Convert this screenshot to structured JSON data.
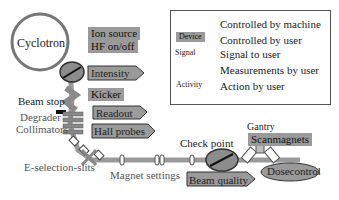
{
  "diagram": {
    "nodes": {
      "cyclotron": "Cyclotron",
      "ion_source": "Ion source",
      "hf": "HF on/off",
      "intensity": "Intensity",
      "kicker": "Kicker",
      "beam_stop": "Beam stop",
      "degrader": "Degrader",
      "collimators": "Collimators",
      "readout": "Readout",
      "hall_probes": "Hall probes",
      "e_selection": "E-selection-slits",
      "magnet_settings": "Magnet settings",
      "check_point": "Check point",
      "beam_quality": "Beam quality",
      "gantry": "Gantry",
      "scanmagnets": "Scanmagnets",
      "dosecontrol": "Dosecontrol"
    },
    "legend": {
      "items": [
        {
          "symbol": "magnet-and-slit",
          "label": "Controlled by machine"
        },
        {
          "symbol": "Device",
          "label": "Controlled by user"
        },
        {
          "symbol": "Signal",
          "label": "Signal to user"
        },
        {
          "symbol": "gauge",
          "label": "Measurements by user"
        },
        {
          "symbol": "Activity",
          "label": "Action by user"
        }
      ]
    },
    "colors": {
      "beamline": "#9a9a9a",
      "device_fill": "#9a9a9a",
      "outline": "#333333"
    }
  }
}
